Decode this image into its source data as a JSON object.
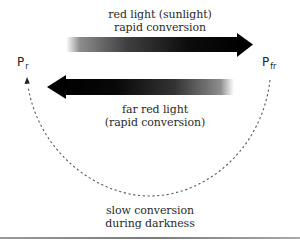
{
  "diagram": {
    "states": {
      "left": {
        "symbol": "P",
        "subscript": "r"
      },
      "right": {
        "symbol": "P",
        "subscript": "fr"
      }
    },
    "forward_arrow": {
      "direction": "Pr to Pfr",
      "line1": "red light (sunlight)",
      "line2": "rapid conversion"
    },
    "reverse_arrow": {
      "direction": "Pfr to Pr",
      "line1": "far red light",
      "line2": "(rapid conversion)"
    },
    "dark_reversion": {
      "direction": "Pfr to Pr (dashed arc)",
      "line1": "slow conversion",
      "line2": "during darkness"
    },
    "colors": {
      "arrow": "#000000",
      "dashed_arc": "#555555",
      "text": "#2a2a2a",
      "rule": "#8a8a8a"
    }
  }
}
